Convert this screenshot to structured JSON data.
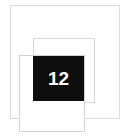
{
  "canvas": {
    "width": 128,
    "height": 139,
    "background_color": "#ffffff"
  },
  "shapes": {
    "back_rect": {
      "name": "back-rectangle",
      "border_color": "#dcdcdc",
      "fill_color": "#ffffff",
      "x": 10,
      "y": 5,
      "width": 110,
      "height": 114
    },
    "middle_rect": {
      "name": "middle-rectangle",
      "border_color": "#d6d6d6",
      "fill_color": "#ffffff",
      "x": 33,
      "y": 38,
      "width": 62,
      "height": 65
    },
    "front_rect": {
      "name": "front-rectangle",
      "border_color": "#d2d2d2",
      "fill_color": "#ffffff",
      "x": 19,
      "y": 55,
      "width": 66,
      "height": 77
    }
  },
  "badge": {
    "label": "12",
    "background_color": "#0d0d0d",
    "text_color": "#ffffff",
    "x": 33,
    "y": 56,
    "width": 51,
    "height": 45
  }
}
